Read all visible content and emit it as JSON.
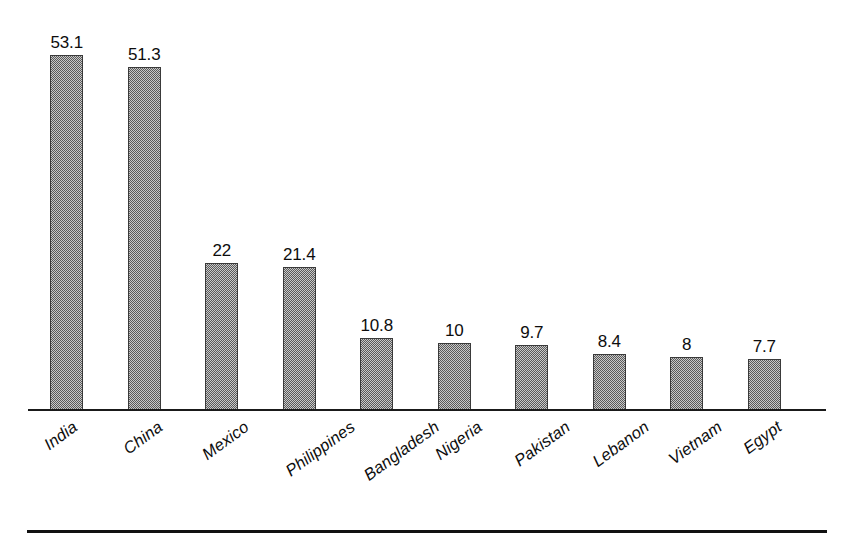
{
  "chart_data": {
    "type": "bar",
    "title": "",
    "subtitle": "",
    "xlabel": "",
    "ylabel": "",
    "ylim": [
      0,
      53.1
    ],
    "grid": false,
    "legend": false,
    "axis": {
      "x_axis_line": true,
      "y_axis_line": false,
      "tick_marks": false
    },
    "categories": [
      "India",
      "China",
      "Mexico",
      "Philippines",
      "Bangladesh",
      "Nigeria",
      "Pakistan",
      "Lebanon",
      "Vietnam",
      "Egypt"
    ],
    "values": [
      53.1,
      51.3,
      22,
      21.4,
      10.8,
      10,
      9.7,
      8.4,
      8,
      7.7
    ],
    "value_labels": [
      "53.1",
      "51.3",
      "22",
      "21.4",
      "10.8",
      "10",
      "9.7",
      "8.4",
      "8",
      "7.7"
    ],
    "bar_style": {
      "fill": "#8c8c8c",
      "pattern": "dithered-checker-gray",
      "border": "#3a3a3a"
    }
  },
  "figure": {
    "background": "#ffffff",
    "bottom_rule_color": "#111111",
    "axis_color": "#1a1a1a"
  }
}
